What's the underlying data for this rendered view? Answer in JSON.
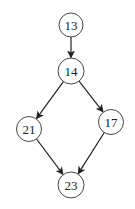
{
  "diagram": {
    "type": "directed-graph",
    "width": 135,
    "height": 209,
    "colors": {
      "background": "#ffffff",
      "node_fill": "#ffffff",
      "node_stroke": "#333333",
      "edge": "#222222",
      "text": "#222222"
    },
    "nodes": [
      {
        "id": "n13",
        "label": "13",
        "cx": 71,
        "cy": 25,
        "r": 12
      },
      {
        "id": "n14",
        "label": "14",
        "cx": 71,
        "cy": 71,
        "r": 13
      },
      {
        "id": "n21",
        "label": "21",
        "cx": 29,
        "cy": 129,
        "r": 12.5
      },
      {
        "id": "n17",
        "label": "17",
        "cx": 111,
        "cy": 122,
        "r": 12.5
      },
      {
        "id": "n23",
        "label": "23",
        "cx": 71,
        "cy": 185,
        "r": 13
      }
    ],
    "edges": [
      {
        "from": "13",
        "to": "14"
      },
      {
        "from": "14",
        "to": "21"
      },
      {
        "from": "14",
        "to": "17"
      },
      {
        "from": "21",
        "to": "23"
      },
      {
        "from": "17",
        "to": "23"
      }
    ]
  }
}
